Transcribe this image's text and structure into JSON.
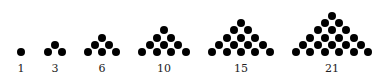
{
  "figures": [
    {
      "value": 1,
      "label": "1",
      "rows": 1,
      "center_x": 21
    },
    {
      "value": 3,
      "label": "3",
      "rows": 2,
      "center_x": 55
    },
    {
      "value": 6,
      "label": "6",
      "rows": 3,
      "center_x": 102
    },
    {
      "value": 10,
      "label": "10",
      "rows": 4,
      "center_x": 164
    },
    {
      "value": 15,
      "label": "15",
      "rows": 5,
      "center_x": 241
    },
    {
      "value": 21,
      "label": "21",
      "rows": 6,
      "center_x": 332
    }
  ],
  "layout": {
    "base_y": 52,
    "row_dy": 7.2,
    "dot_dx": 14.4,
    "label_y": 63
  },
  "colors": {
    "dot": "#000000",
    "label": "#222222",
    "background": "#ffffff"
  }
}
